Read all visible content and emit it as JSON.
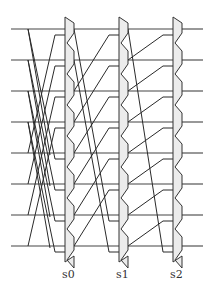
{
  "diagram": {
    "type": "barrel-shifter",
    "bit_count": 8,
    "stages": [
      {
        "label": "s0",
        "shift": 4
      },
      {
        "label": "s1",
        "shift": 2
      },
      {
        "label": "s2",
        "shift": 1
      }
    ],
    "colors": {
      "wire": "#2a2a2a",
      "mux_fill": "#ececec",
      "mux_stroke": "#333333"
    }
  }
}
